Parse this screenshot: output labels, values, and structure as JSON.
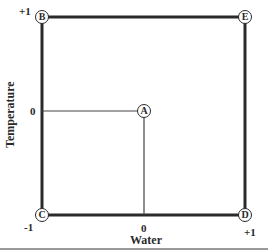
{
  "diagram": {
    "axes": {
      "x_label": "Water",
      "y_label": "Temperature",
      "x_ticks": {
        "min": "-1",
        "mid": "0",
        "max": "+1"
      },
      "y_ticks": {
        "max": "+1",
        "mid": "0"
      }
    },
    "nodes": {
      "A": {
        "label": "A",
        "x": 0,
        "y": 0
      },
      "B": {
        "label": "B",
        "x": -1,
        "y": 1
      },
      "C": {
        "label": "C",
        "x": -1,
        "y": -1
      },
      "D": {
        "label": "D",
        "x": 1,
        "y": -1
      },
      "E": {
        "label": "E",
        "x": 1,
        "y": 1
      }
    },
    "colors": {
      "line": "#2a2a2a",
      "rule": "#9a9a9a",
      "background": "#ffffff"
    }
  }
}
